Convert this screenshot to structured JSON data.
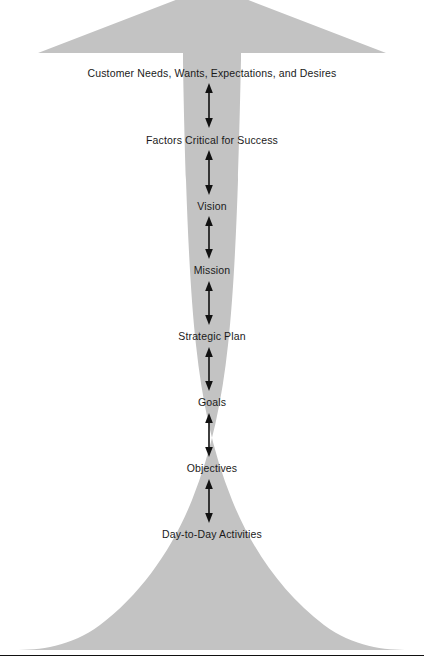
{
  "diagram": {
    "type": "funnel-hierarchy-arrow",
    "shape": {
      "fill_color": "#c3c3c3",
      "arrow_direction": "up",
      "description": "Upward pointing arrow with wide arrowhead at top, narrow shaft in the middle, and flared trumpet base at the bottom"
    },
    "levels": [
      {
        "label": "Customer Needs, Wants, Expectations, and Desires",
        "y": 73
      },
      {
        "label": "Factors Critical for Success",
        "y": 140
      },
      {
        "label": "Vision",
        "y": 206
      },
      {
        "label": "Mission",
        "y": 270
      },
      {
        "label": "Strategic Plan",
        "y": 336
      },
      {
        "label": "Goals",
        "y": 402
      },
      {
        "label": "Objectives",
        "y": 468
      },
      {
        "label": "Day-to-Day Activities",
        "y": 534
      }
    ],
    "connectors": [
      {
        "name": "double-headed-arrow",
        "from": "Customer Needs, Wants, Expectations, and Desires",
        "to": "Factors Critical for Success",
        "top": 84,
        "bottom": 127
      },
      {
        "name": "double-headed-arrow",
        "from": "Factors Critical for Success",
        "to": "Vision",
        "top": 151,
        "bottom": 194
      },
      {
        "name": "double-headed-arrow",
        "from": "Vision",
        "to": "Mission",
        "top": 217,
        "bottom": 258
      },
      {
        "name": "double-headed-arrow",
        "from": "Mission",
        "to": "Strategic Plan",
        "top": 281,
        "bottom": 324
      },
      {
        "name": "double-headed-arrow",
        "from": "Strategic Plan",
        "to": "Goals",
        "top": 347,
        "bottom": 390
      },
      {
        "name": "double-headed-arrow",
        "from": "Goals",
        "to": "Objectives",
        "top": 413,
        "bottom": 456
      },
      {
        "name": "double-headed-arrow",
        "from": "Objectives",
        "to": "Day-to-Day Activities",
        "top": 479,
        "bottom": 522
      }
    ],
    "footer_rule": {
      "y": 655,
      "color": "#111111"
    }
  }
}
